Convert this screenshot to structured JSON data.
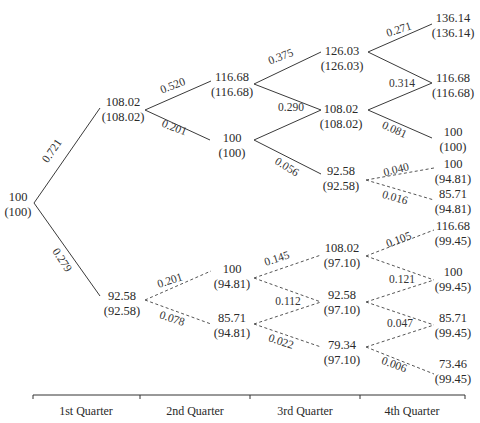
{
  "diagram": {
    "type": "binomial-tree",
    "axis": {
      "y": 395,
      "ticks_x": [
        33,
        140,
        250,
        360,
        465
      ],
      "labels": [
        {
          "text": "1st Quarter",
          "x": 86
        },
        {
          "text": "2nd Quarter",
          "x": 195
        },
        {
          "text": "3rd Quarter",
          "x": 305
        },
        {
          "text": "4th Quarter",
          "x": 412
        }
      ]
    },
    "nodes": [
      {
        "id": "r",
        "value": "100",
        "sub": "(100)",
        "x": 18,
        "y": 201,
        "in": [
          33,
          203
        ],
        "out": [
          34,
          203
        ]
      },
      {
        "id": "a1",
        "value": "108.02",
        "sub": "(108.02)",
        "x": 123,
        "y": 106,
        "in": [
          100,
          108
        ],
        "out": [
          145,
          110
        ]
      },
      {
        "id": "a2",
        "value": "92.58",
        "sub": "(92.58)",
        "x": 122,
        "y": 300,
        "in": [
          100,
          296
        ],
        "out": [
          145,
          300
        ]
      },
      {
        "id": "b1",
        "value": "116.68",
        "sub": "(116.68)",
        "x": 232,
        "y": 81,
        "in": [
          211,
          81
        ],
        "out": [
          254,
          84
        ]
      },
      {
        "id": "b2",
        "value": "100",
        "sub": "(100)",
        "x": 232,
        "y": 142,
        "in": [
          210,
          140
        ],
        "out": [
          254,
          140
        ]
      },
      {
        "id": "b3",
        "value": "100",
        "sub": "(94.81)",
        "x": 232,
        "y": 273,
        "in": [
          211,
          271
        ],
        "out": [
          254,
          278
        ]
      },
      {
        "id": "b4",
        "value": "85.71",
        "sub": "(94.81)",
        "x": 232,
        "y": 322,
        "in": [
          211,
          324
        ],
        "out": [
          254,
          324
        ]
      },
      {
        "id": "c1",
        "value": "126.03",
        "sub": "(126.03)",
        "x": 342,
        "y": 55,
        "in": [
          321,
          52
        ],
        "out": [
          368,
          52
        ]
      },
      {
        "id": "c2",
        "value": "108.02",
        "sub": "(108.02)",
        "x": 341,
        "y": 113,
        "in": [
          321,
          110
        ],
        "out": [
          368,
          110
        ]
      },
      {
        "id": "c3",
        "value": "92.58",
        "sub": "(92.58)",
        "x": 341,
        "y": 175,
        "in": [
          321,
          174
        ],
        "out": [
          366,
          180
        ]
      },
      {
        "id": "c4",
        "value": "108.02",
        "sub": "(97.10)",
        "x": 342,
        "y": 252,
        "in": [
          321,
          255
        ],
        "out": [
          366,
          256
        ]
      },
      {
        "id": "c5",
        "value": "92.58",
        "sub": "(97.10)",
        "x": 342,
        "y": 299,
        "in": [
          321,
          302
        ],
        "out": [
          366,
          302
        ]
      },
      {
        "id": "c6",
        "value": "79.34",
        "sub": "(97.10)",
        "x": 342,
        "y": 349,
        "in": [
          321,
          347
        ],
        "out": [
          366,
          347
        ]
      },
      {
        "id": "d1",
        "value": "136.14",
        "sub": "(136.14)",
        "x": 453,
        "y": 22,
        "in": [
          432,
          24
        ],
        "out": [
          432,
          24
        ]
      },
      {
        "id": "d2",
        "value": "116.68",
        "sub": "(116.68)",
        "x": 453,
        "y": 82,
        "in": [
          432,
          83
        ],
        "out": [
          432,
          83
        ]
      },
      {
        "id": "d3",
        "value": "100",
        "sub": "(100)",
        "x": 453,
        "y": 136,
        "in": [
          432,
          138
        ],
        "out": [
          432,
          138
        ]
      },
      {
        "id": "d4",
        "value": "100",
        "sub": "(94.81)",
        "x": 453,
        "y": 168,
        "in": [
          434,
          168
        ],
        "out": [
          434,
          168
        ]
      },
      {
        "id": "d5",
        "value": "85.71",
        "sub": "(94.81)",
        "x": 453,
        "y": 198,
        "in": [
          434,
          200
        ],
        "out": [
          434,
          200
        ]
      },
      {
        "id": "d6",
        "value": "116.68",
        "sub": "(99.45)",
        "x": 453,
        "y": 230,
        "in": [
          434,
          230
        ],
        "out": [
          434,
          230
        ]
      },
      {
        "id": "d7",
        "value": "100",
        "sub": "(99.45)",
        "x": 453,
        "y": 276,
        "in": [
          434,
          280
        ],
        "out": [
          434,
          280
        ]
      },
      {
        "id": "d8",
        "value": "85.71",
        "sub": "(99.45)",
        "x": 453,
        "y": 322,
        "in": [
          434,
          325
        ],
        "out": [
          434,
          325
        ]
      },
      {
        "id": "d9",
        "value": "73.46",
        "sub": "(99.45)",
        "x": 453,
        "y": 368,
        "in": [
          434,
          374
        ],
        "out": [
          434,
          374
        ]
      }
    ],
    "edges": [
      {
        "from": "r",
        "to": "a1",
        "prob": "0.721",
        "dashed": false,
        "lx": 55,
        "ly": 153,
        "rot": -55
      },
      {
        "from": "r",
        "to": "a2",
        "prob": "0.279",
        "dashed": false,
        "lx": 59,
        "ly": 262,
        "rot": 57
      },
      {
        "from": "a1",
        "to": "b1",
        "prob": "0.520",
        "dashed": false,
        "lx": 174,
        "ly": 89,
        "rot": -21
      },
      {
        "from": "a1",
        "to": "b2",
        "prob": "0.201",
        "dashed": false,
        "lx": 173,
        "ly": 131,
        "rot": 21
      },
      {
        "from": "a2",
        "to": "b3",
        "prob": "0.201",
        "dashed": true,
        "lx": 171,
        "ly": 284,
        "rot": -18
      },
      {
        "from": "a2",
        "to": "b4",
        "prob": "0.078",
        "dashed": true,
        "lx": 171,
        "ly": 322,
        "rot": 18
      },
      {
        "from": "b1",
        "to": "c1",
        "prob": "0.375",
        "dashed": false,
        "lx": 282,
        "ly": 60,
        "rot": -21
      },
      {
        "from": "b1",
        "to": "c2",
        "prob": "0.290",
        "dashed": false,
        "lx": 291,
        "ly": 111,
        "rot": 0
      },
      {
        "from": "b2",
        "to": "c2",
        "prob": "",
        "dashed": false,
        "lx": 0,
        "ly": 0,
        "rot": 0
      },
      {
        "from": "b2",
        "to": "c3",
        "prob": "0.056",
        "dashed": false,
        "lx": 285,
        "ly": 170,
        "rot": 32
      },
      {
        "from": "b3",
        "to": "c4",
        "prob": "0.145",
        "dashed": true,
        "lx": 278,
        "ly": 262,
        "rot": -18
      },
      {
        "from": "b3",
        "to": "c5",
        "prob": "0.112",
        "dashed": true,
        "lx": 288,
        "ly": 305,
        "rot": 0
      },
      {
        "from": "b4",
        "to": "c5",
        "prob": "",
        "dashed": true,
        "lx": 0,
        "ly": 0,
        "rot": 0
      },
      {
        "from": "b4",
        "to": "c6",
        "prob": "0.022",
        "dashed": true,
        "lx": 280,
        "ly": 345,
        "rot": 18
      },
      {
        "from": "c1",
        "to": "d1",
        "prob": "0.271",
        "dashed": false,
        "lx": 400,
        "ly": 33,
        "rot": -18
      },
      {
        "from": "c1",
        "to": "d2",
        "prob": "0.314",
        "dashed": false,
        "lx": 402,
        "ly": 87,
        "rot": 0
      },
      {
        "from": "c2",
        "to": "d2",
        "prob": "",
        "dashed": false,
        "lx": 0,
        "ly": 0,
        "rot": 0
      },
      {
        "from": "c2",
        "to": "d3",
        "prob": "0.081",
        "dashed": false,
        "lx": 393,
        "ly": 133,
        "rot": 24
      },
      {
        "from": "c3",
        "to": "d4",
        "prob": "0.040",
        "dashed": true,
        "lx": 397,
        "ly": 173,
        "rot": -14
      },
      {
        "from": "c3",
        "to": "d5",
        "prob": "0.016",
        "dashed": true,
        "lx": 394,
        "ly": 201,
        "rot": 16
      },
      {
        "from": "c4",
        "to": "d6",
        "prob": "0.105",
        "dashed": true,
        "lx": 400,
        "ly": 243,
        "rot": -20
      },
      {
        "from": "c4",
        "to": "d7",
        "prob": "0.121",
        "dashed": true,
        "lx": 402,
        "ly": 283,
        "rot": 0
      },
      {
        "from": "c5",
        "to": "d7",
        "prob": "",
        "dashed": true,
        "lx": 0,
        "ly": 0,
        "rot": 0
      },
      {
        "from": "c5",
        "to": "d8",
        "prob": "0.047",
        "dashed": true,
        "lx": 400,
        "ly": 327,
        "rot": 0
      },
      {
        "from": "c6",
        "to": "d8",
        "prob": "",
        "dashed": true,
        "lx": 0,
        "ly": 0,
        "rot": 0
      },
      {
        "from": "c6",
        "to": "d9",
        "prob": "0.006",
        "dashed": true,
        "lx": 393,
        "ly": 368,
        "rot": 20
      }
    ]
  }
}
